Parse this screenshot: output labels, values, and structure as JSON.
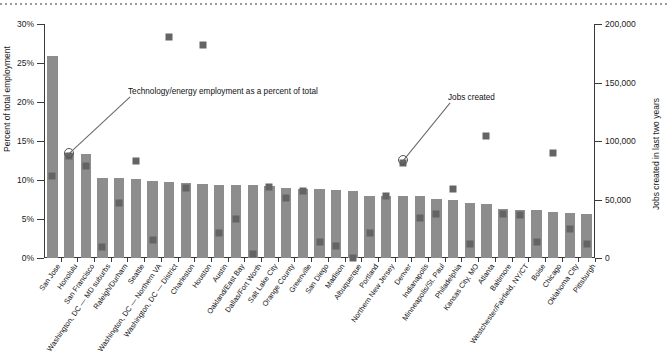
{
  "chart_data": {
    "type": "bar",
    "title": "",
    "subtitle": "",
    "ylabel": "Percent of total employment",
    "ylabel_right": "Jobs created in last two years",
    "xlabel": "",
    "ylim": [
      0,
      30
    ],
    "ylim_right": [
      0,
      200000
    ],
    "yticks": [
      "0%",
      "5%",
      "10%",
      "15%",
      "20%",
      "25%",
      "30%"
    ],
    "ytick_values": [
      0,
      5,
      10,
      15,
      20,
      25,
      30
    ],
    "yticks_right": [
      "0",
      "50,000",
      "100,000",
      "150,000",
      "200,000"
    ],
    "ytick_values_right": [
      0,
      50000,
      100000,
      150000,
      200000
    ],
    "grid": false,
    "legend_position": "annotation",
    "series": [
      {
        "name": "Technology/energy employment as a percent of total",
        "kind": "bar",
        "axis": "left",
        "color": "#8d8d8d",
        "values": [
          25.9,
          13.5,
          13.3,
          10.3,
          10.3,
          10.1,
          9.9,
          9.7,
          9.6,
          9.5,
          9.4,
          9.4,
          9.4,
          9.2,
          9.0,
          8.9,
          8.9,
          8.7,
          8.6,
          8.0,
          7.9,
          7.9,
          7.9,
          7.6,
          7.4,
          7.0,
          6.9,
          6.3,
          6.2,
          6.1,
          5.9,
          5.8,
          5.7
        ]
      },
      {
        "name": "Jobs created",
        "kind": "marker",
        "axis": "right",
        "color": "#646464",
        "values": [
          73000,
          90000,
          82000,
          12000,
          50000,
          86000,
          18000,
          192000,
          63000,
          185000,
          24000,
          36000,
          6000,
          64000,
          54000,
          60000,
          17000,
          13000,
          3000,
          24000,
          56000,
          84000,
          37000,
          41000,
          62000,
          15000,
          107000,
          41000,
          40000,
          17000,
          93000,
          28000,
          15000
        ]
      }
    ],
    "categories": [
      "San Jose",
      "Honolulu",
      "San Francisco",
      "Washington, DC — MD suburbs",
      "Raleigh/Durham",
      "Seattle",
      "Washington, DC — Northern VA",
      "Washington, DC — District",
      "Charleston",
      "Houston",
      "Austin",
      "Oakland/East Bay",
      "Dallas/Fort Worth",
      "Salt Lake City",
      "Orange County",
      "Greenville",
      "San Diego",
      "Madison",
      "Albuquerque",
      "Portland",
      "Northern New Jersey",
      "Denver",
      "Indianapolis",
      "Minneapolis/St. Paul",
      "Philadelphia",
      "Kansas City, MO",
      "Atlanta",
      "Baltimore",
      "Westchester/Fairfield, NY/CT",
      "Boise",
      "Chicago",
      "Oklahoma City",
      "Pittsburgh"
    ],
    "annotations": [
      {
        "text": "Technology/energy employment as a percent of total",
        "points_to_category": "Honolulu",
        "points_to_value_pct": 13.5
      },
      {
        "text": "Jobs created",
        "points_to_category": "Denver",
        "points_to_value_jobs": 84000
      }
    ]
  },
  "colors": {
    "bar": "#8d8d8d",
    "marker": "#646464",
    "axis": "#3a3a3a",
    "text": "#111111",
    "rule": "#9a9a9a"
  }
}
